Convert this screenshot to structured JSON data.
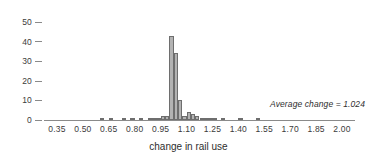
{
  "chart_data": {
    "type": "bar",
    "title": "",
    "subtitle": "",
    "xlabel": "change in rail use",
    "ylabel": "",
    "xlim": [
      0.275,
      2.075
    ],
    "ylim": [
      0,
      52
    ],
    "grid": false,
    "legend": null,
    "bin_width": 0.025,
    "xticks": [
      "0.35",
      "0.50",
      "0.65",
      "0.80",
      "0.95",
      "1.10",
      "1.25",
      "1.40",
      "1.55",
      "1.70",
      "1.85",
      "2.00"
    ],
    "xtick_values": [
      0.35,
      0.5,
      0.65,
      0.8,
      0.95,
      1.1,
      1.25,
      1.4,
      1.55,
      1.7,
      1.85,
      2.0
    ],
    "yticks": [
      "0",
      "10",
      "20",
      "30",
      "40",
      "50"
    ],
    "ytick_values": [
      0,
      10,
      20,
      30,
      40,
      50
    ],
    "bin_left_edges": [
      0.6,
      0.625,
      0.65,
      0.675,
      0.7,
      0.725,
      0.75,
      0.775,
      0.8,
      0.825,
      0.85,
      0.875,
      0.9,
      0.925,
      0.95,
      0.975,
      1.0,
      1.025,
      1.05,
      1.075,
      1.1,
      1.125,
      1.15,
      1.175,
      1.2,
      1.225,
      1.25,
      1.275,
      1.3,
      1.325,
      1.35,
      1.375,
      1.4,
      1.425,
      1.45,
      1.475,
      1.5,
      1.525
    ],
    "values": [
      1,
      0,
      1,
      0,
      0,
      1,
      0,
      1,
      0,
      1,
      0,
      1,
      1,
      1,
      2,
      2,
      43,
      34,
      10,
      2,
      4,
      3,
      2,
      1,
      1,
      1,
      1,
      0,
      1,
      0,
      0,
      0,
      1,
      0,
      0,
      0,
      1,
      0
    ],
    "annotations": [
      {
        "text": "Average change = 1.024",
        "value": 1.024,
        "style": "italic"
      }
    ],
    "colors": {
      "bar_fill": "#b3b3b3",
      "bar_stroke": "#6e6e6e",
      "axis": "#8a8a8a",
      "text": "#3b3b3b"
    }
  }
}
